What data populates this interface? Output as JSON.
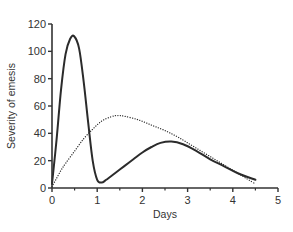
{
  "chart_data": {
    "type": "line",
    "title": "",
    "xlabel": "Days",
    "ylabel": "Severity of emesis",
    "xlim": [
      0,
      5
    ],
    "ylim": [
      0,
      120
    ],
    "xticks": [
      0,
      1,
      2,
      3,
      4,
      5
    ],
    "xminor_ticks": [
      0.5,
      1.5,
      2.5,
      3.5,
      4.5
    ],
    "yticks": [
      0,
      20,
      40,
      60,
      80,
      100,
      120
    ],
    "grid": false,
    "legend": null,
    "series": [
      {
        "name": "solid",
        "style": "solid",
        "color": "#2b2b2b",
        "x": [
          0,
          0.1,
          0.2,
          0.3,
          0.4,
          0.49,
          0.6,
          0.7,
          0.8,
          0.9,
          1.0,
          1.1,
          1.2,
          1.4,
          1.6,
          1.8,
          2.0,
          2.2,
          2.4,
          2.64,
          2.9,
          3.2,
          3.5,
          3.8,
          4.1,
          4.5
        ],
        "y": [
          3,
          35,
          72,
          98,
          109,
          111,
          102,
          78,
          48,
          20,
          6,
          4,
          6,
          11,
          16,
          21,
          26,
          30,
          33,
          34,
          32,
          27,
          21,
          16,
          11,
          6
        ]
      },
      {
        "name": "dotted",
        "style": "dotted",
        "color": "#2b2b2b",
        "x": [
          0,
          0.1,
          0.2,
          0.3,
          0.5,
          0.7,
          0.9,
          1.1,
          1.3,
          1.44,
          1.6,
          1.9,
          2.2,
          2.5,
          2.8,
          3.1,
          3.4,
          3.7,
          4.0,
          4.3,
          4.5
        ],
        "y": [
          1,
          7,
          13,
          18,
          27,
          36,
          43,
          49,
          52,
          53,
          52.5,
          50,
          46,
          42,
          37,
          31,
          25,
          19,
          13,
          7,
          3
        ]
      }
    ]
  },
  "labels": {
    "xlabel": "Days",
    "ylabel": "Severity of emesis",
    "xticks": [
      "0",
      "1",
      "2",
      "3",
      "4",
      "5"
    ],
    "yticks": [
      "0",
      "20",
      "40",
      "60",
      "80",
      "100",
      "120"
    ]
  }
}
